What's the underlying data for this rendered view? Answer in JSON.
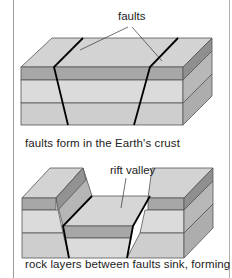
{
  "diagram": {
    "top": {
      "label": "faults",
      "caption": "faults form in the Earth's crust"
    },
    "bottom": {
      "label": "rift valley",
      "caption": "rock layers between faults sink, forming"
    },
    "colors": {
      "top_face": "#d4d4d4",
      "dark_band": "#a6a6a6",
      "light_band": "#dcdcdc",
      "mid_band": "#cfcfcf",
      "side_face": "#b4b4b4",
      "side_dark": "#8f8f8f",
      "edge": "#444444",
      "fault": "#000000"
    }
  }
}
